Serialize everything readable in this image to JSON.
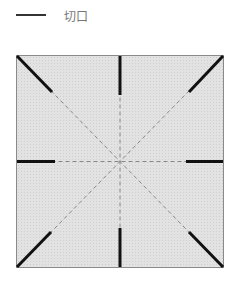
{
  "legend": {
    "items": [
      {
        "label": "切口",
        "line_color": "#333333",
        "style": "solid"
      }
    ]
  },
  "diagram": {
    "square": {
      "fill": "#dcdcdc",
      "border": "#888888"
    },
    "fold_line_color": "#888888",
    "cut_line_color": "#111111",
    "cut_count": 8
  }
}
